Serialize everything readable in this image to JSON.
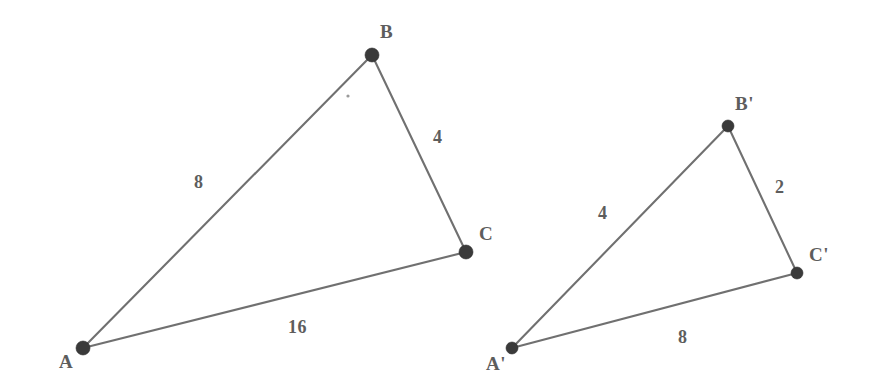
{
  "figure": {
    "kind": "geometry-diagram",
    "background_color": "#ffffff",
    "line_color": "#646464",
    "vertex_color": "#3a3a3a",
    "text_color": "#5d5d5d"
  },
  "triangles": [
    {
      "id": "triangle-abc",
      "name": "Triangle ABC",
      "vertices": [
        {
          "label": "A",
          "x": 83,
          "y": 348,
          "label_x": 59,
          "label_y": 352,
          "dot_r": 7
        },
        {
          "label": "B",
          "x": 372,
          "y": 55,
          "label_x": 380,
          "label_y": 22,
          "dot_r": 7
        },
        {
          "label": "C",
          "x": 466,
          "y": 252,
          "label_x": 479,
          "label_y": 224,
          "dot_r": 7
        }
      ],
      "sides": [
        {
          "id": "side-ab",
          "from": "A",
          "to": "B",
          "length": "8",
          "label_x": 194,
          "label_y": 173
        },
        {
          "id": "side-bc",
          "from": "B",
          "to": "C",
          "length": "4",
          "label_x": 433,
          "label_y": 128
        },
        {
          "id": "side-ac",
          "from": "A",
          "to": "C",
          "length": "16",
          "label_x": 288,
          "label_y": 318
        }
      ]
    },
    {
      "id": "triangle-abc-prime",
      "name": "Triangle A'B'C'",
      "vertices": [
        {
          "label": "A'",
          "x": 512,
          "y": 348,
          "label_x": 486,
          "label_y": 354,
          "dot_r": 6
        },
        {
          "label": "B'",
          "x": 728,
          "y": 126,
          "label_x": 735,
          "label_y": 94,
          "dot_r": 6
        },
        {
          "label": "C'",
          "x": 797,
          "y": 273,
          "label_x": 809,
          "label_y": 245,
          "dot_r": 6
        }
      ],
      "sides": [
        {
          "id": "side-ab-prime",
          "from": "A'",
          "to": "B'",
          "length": "4",
          "label_x": 598,
          "label_y": 204
        },
        {
          "id": "side-bc-prime",
          "from": "B'",
          "to": "C'",
          "length": "2",
          "label_x": 775,
          "label_y": 178
        },
        {
          "id": "side-ac-prime",
          "from": "A'",
          "to": "C'",
          "length": "8",
          "label_x": 678,
          "label_y": 328
        }
      ]
    }
  ],
  "artifacts": [
    {
      "id": "speck-dot",
      "x": 348,
      "y": 96,
      "r": 1.6
    }
  ]
}
